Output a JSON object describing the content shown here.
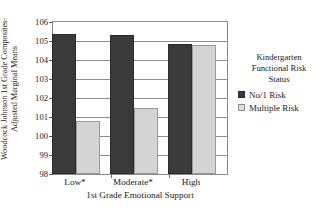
{
  "chart_data": {
    "type": "bar",
    "title": "",
    "categories": [
      "Low*",
      "Moderate*",
      "High"
    ],
    "series": [
      {
        "name": "No/1 Risk",
        "values": [
          105.35,
          105.3,
          104.85
        ],
        "color": "#3a3a3a"
      },
      {
        "name": "Multiple Risk",
        "values": [
          100.8,
          101.45,
          104.8
        ],
        "color": "#d4d4d4"
      }
    ],
    "xlabel": "1st Grade Emotional Support",
    "ylabel": "Woodcock Johnson 1st Grade Composites-Adjusted Marginal Means",
    "ylabel_line1": "Woodcock Johnson 1st Grade Composites-",
    "ylabel_line2": "Adjusted Marginal Means",
    "ylim": [
      98,
      106
    ],
    "ytick_step": 1,
    "yticks": [
      "106",
      "105",
      "104",
      "103",
      "102",
      "101",
      "100",
      "99",
      "98"
    ],
    "grid": true,
    "grid_axis": "y",
    "legend_position": "right",
    "legend_title": "Kindergarten Functional Risk Status",
    "legend_title_lines": [
      "Kindergarten",
      "Functional Risk",
      "Status"
    ]
  }
}
